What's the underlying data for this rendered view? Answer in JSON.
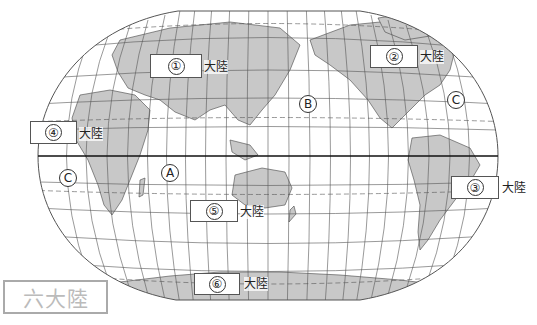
{
  "title": "六大陸",
  "colors": {
    "land": "#c8c8c8",
    "ocean": "#ffffff",
    "grid": "#666666",
    "border": "#555555"
  },
  "continents": [
    {
      "number": "①",
      "suffix": "大陸",
      "box": [
        150,
        54,
        52,
        24
      ],
      "suffix_pos": [
        204,
        60
      ]
    },
    {
      "number": "②",
      "suffix": "大陸",
      "box": [
        370,
        45,
        48,
        23
      ],
      "suffix_pos": [
        420,
        50
      ]
    },
    {
      "number": "③",
      "suffix": "大陸",
      "box": [
        451,
        176,
        48,
        23
      ],
      "suffix_pos": [
        502,
        181
      ]
    },
    {
      "number": "④",
      "suffix": "大陸",
      "box": [
        30,
        121,
        47,
        23
      ],
      "suffix_pos": [
        79,
        127
      ]
    },
    {
      "number": "⑤",
      "suffix": "大陸",
      "box": [
        190,
        200,
        48,
        22
      ],
      "suffix_pos": [
        240,
        205
      ]
    },
    {
      "number": "⑥",
      "suffix": "大陸",
      "box": [
        194,
        273,
        46,
        22
      ],
      "suffix_pos": [
        244,
        277
      ]
    }
  ],
  "oceans": [
    {
      "letter": "A",
      "pos": [
        161,
        164
      ]
    },
    {
      "letter": "B",
      "pos": [
        299,
        95
      ]
    },
    {
      "letter": "C",
      "pos": [
        447,
        91
      ]
    },
    {
      "letter": "C",
      "pos": [
        59,
        169
      ]
    }
  ]
}
